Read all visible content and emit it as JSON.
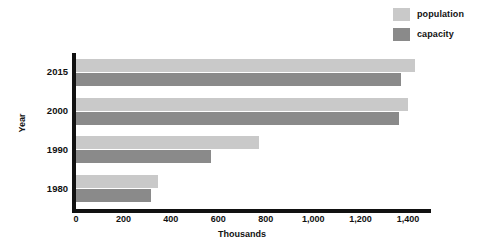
{
  "chart_data": {
    "type": "bar",
    "orientation": "horizontal",
    "title": "",
    "xlabel": "Thousands",
    "ylabel": "Year",
    "categories": [
      "2015",
      "2000",
      "1990",
      "1980"
    ],
    "series": [
      {
        "name": "population",
        "color": "#c9c9c9",
        "values": [
          1430,
          1400,
          770,
          345
        ]
      },
      {
        "name": "capacity",
        "color": "#8a8a8a",
        "values": [
          1370,
          1360,
          570,
          315
        ]
      }
    ],
    "xlim": [
      0,
      1400
    ],
    "xticks": [
      0,
      200,
      400,
      600,
      800,
      1000,
      1200,
      1400
    ],
    "xtick_labels": [
      "0",
      "200",
      "400",
      "600",
      "800",
      "1,000",
      "1,200",
      "1,400"
    ],
    "ytick_labels": [
      "2015",
      "2000",
      "1990",
      "1980"
    ],
    "grid": false,
    "legend_position": "top-right"
  },
  "legend": {
    "items": [
      {
        "label": "population",
        "color": "#c9c9c9"
      },
      {
        "label": "capacity",
        "color": "#8a8a8a"
      }
    ]
  },
  "axes": {
    "x_title": "Thousands",
    "y_title": "Year"
  },
  "colors": {
    "population": "#c9c9c9",
    "capacity": "#8a8a8a",
    "axis": "#111111",
    "background": "#ffffff"
  }
}
